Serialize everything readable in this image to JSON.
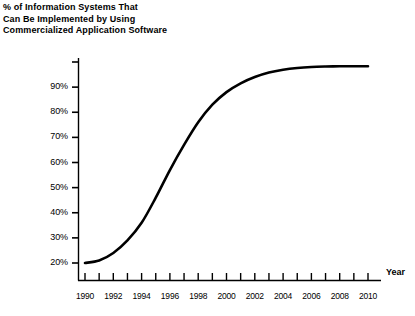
{
  "chart_data": {
    "type": "line",
    "title": "% of Information Systems That Can Be Implemented by Using Commercialized Application Software",
    "title_lines": [
      "% of Information Systems That",
      "Can Be Implemented by Using",
      "Commercialized Application Software"
    ],
    "xlabel": "Year",
    "ylabel": "",
    "xlim": [
      1990,
      2010
    ],
    "ylim": [
      20,
      100
    ],
    "grid": false,
    "legend": "none",
    "line_color": "#000000",
    "x": [
      1990,
      1991,
      1992,
      1993,
      1994,
      1995,
      1996,
      1997,
      1998,
      1999,
      2000,
      2001,
      2002,
      2003,
      2004,
      2005,
      2006,
      2007,
      2008,
      2009,
      2010
    ],
    "values": [
      20,
      21,
      24,
      29,
      36,
      46,
      57,
      67,
      76,
      83,
      88,
      91.5,
      94,
      95.8,
      96.9,
      97.6,
      98,
      98.2,
      98.3,
      98.3,
      98.3
    ],
    "y_tick_values": [
      20,
      30,
      40,
      50,
      60,
      70,
      80,
      90,
      100
    ],
    "y_tick_labels": [
      "20%",
      "30%",
      "40%",
      "50%",
      "60%",
      "70%",
      "80%",
      "90%",
      ""
    ],
    "x_tick_values": [
      1990,
      1991,
      1992,
      1993,
      1994,
      1995,
      1996,
      1997,
      1998,
      1999,
      2000,
      2001,
      2002,
      2003,
      2004,
      2005,
      2006,
      2007,
      2008,
      2009,
      2010
    ],
    "x_tick_labels": [
      "1990",
      "",
      "1992",
      "",
      "1994",
      "",
      "1996",
      "",
      "1998",
      "",
      "2000",
      "",
      "2002",
      "",
      "2004",
      "",
      "2006",
      "",
      "2008",
      "",
      "2010"
    ],
    "x_labeled_years": [
      "1990",
      "1992",
      "1994",
      "1996",
      "1998",
      "2000",
      "2002",
      "2004",
      "2006",
      "2008",
      "2010"
    ]
  }
}
